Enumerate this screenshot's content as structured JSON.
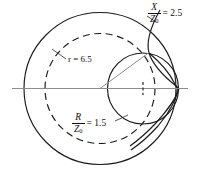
{
  "figure": {
    "type": "impedance-circle-diagram",
    "background_color": "#ffffff",
    "line_color": "#1a1a1a",
    "axis_color": "#8d8d8d"
  },
  "labels": {
    "reactance": {
      "numerator": "X",
      "denominator": "Z",
      "denominator_subscript": "0",
      "equals_value": "= 2.5",
      "value": 2.5,
      "name": "X/Z0 = 2.5"
    },
    "resistance": {
      "numerator": "R",
      "denominator": "Z",
      "denominator_subscript": "0",
      "equals_value": "= 1.5",
      "value": 1.5,
      "name": "R/Z0 = 1.5"
    },
    "radius": {
      "variable": "r",
      "equals_value": "= 6.5",
      "value": 6.5,
      "text": "r = 6.5",
      "name": "r = 6.5"
    }
  },
  "geometry": {
    "origin": {
      "x": 100,
      "y": 88.5
    },
    "outer_circle": {
      "cx": 100,
      "cy": 88.5,
      "r": 76,
      "style": "solid"
    },
    "dashed_circle": {
      "cx": 100,
      "cy": 88.5,
      "r": 55,
      "style": "dashed"
    },
    "resistance_circle": {
      "cx": 143,
      "cy": 88.5,
      "r": 35.5,
      "style": "solid"
    },
    "reactance_arc": {
      "style": "solid"
    },
    "axis_line": {
      "x1": 12,
      "y1": 88.5,
      "x2": 188,
      "y2": 88.5
    },
    "radius_line": {
      "x1": 100,
      "y1": 88.5,
      "x2": 149,
      "y2": 52.5
    },
    "intersection_point": {
      "x": 149,
      "y": 52.5
    }
  }
}
